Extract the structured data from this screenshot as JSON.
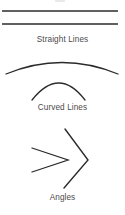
{
  "figure": {
    "background_color": "#ffffff",
    "stroke_color": "#2b2b2b",
    "caption_color": "#4a4a4a",
    "width": 125,
    "height": 215
  },
  "sections": [
    {
      "id": "straight-lines",
      "label": "Straight Lines",
      "shape_kind": "line",
      "shapes": [
        {
          "name": "straight-line-top",
          "x1": 2,
          "y1": 11,
          "x2": 118,
          "y2": 11,
          "stroke_width": 1.4
        },
        {
          "name": "straight-line-bottom",
          "x1": 2,
          "y1": 24,
          "x2": 118,
          "y2": 24,
          "stroke_width": 1.4
        }
      ]
    },
    {
      "id": "curved-lines",
      "label": "Curved Lines",
      "shape_kind": "arc",
      "shapes": [
        {
          "name": "curved-line-outer-arc",
          "path": "M 6 74 Q 62 51 118 74",
          "stroke_width": 1.3
        },
        {
          "name": "curved-line-inner-arc",
          "path": "M 32 100 Q 59 66 85 100",
          "stroke_width": 1.3
        }
      ]
    },
    {
      "id": "angles",
      "label": "Angles",
      "shape_kind": "angle",
      "shapes": [
        {
          "name": "angle-narrow",
          "path": "M 32 148 L 68 160 L 32 172",
          "stroke_width": 1.3
        },
        {
          "name": "angle-wide",
          "path": "M 65 129 L 88 160 L 64 188",
          "stroke_width": 1.4
        }
      ]
    }
  ]
}
